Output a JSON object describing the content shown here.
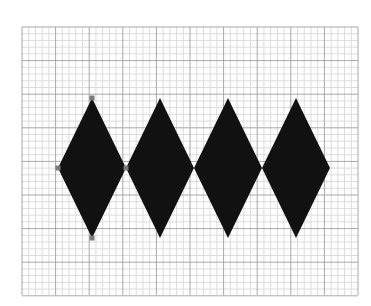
{
  "canvas": {
    "width": 371,
    "height": 306,
    "background": "#ffffff"
  },
  "grid": {
    "x": 22,
    "y": 27,
    "width": 336,
    "height": 268,
    "major_step": 33.6,
    "minor_divisions": 5,
    "major_color": "#a8a8a8",
    "minor_color": "#dcdcdc"
  },
  "shapes": {
    "fill": "#111111",
    "handle_color": "#7a7a7a",
    "diamonds": [
      {
        "cx": 92,
        "cy": 168,
        "w": 68,
        "h": 140,
        "selected": true
      },
      {
        "cx": 160,
        "cy": 168,
        "w": 68,
        "h": 140,
        "selected": false
      },
      {
        "cx": 228,
        "cy": 168,
        "w": 68,
        "h": 140,
        "selected": false
      },
      {
        "cx": 296,
        "cy": 168,
        "w": 68,
        "h": 140,
        "selected": false
      }
    ]
  }
}
